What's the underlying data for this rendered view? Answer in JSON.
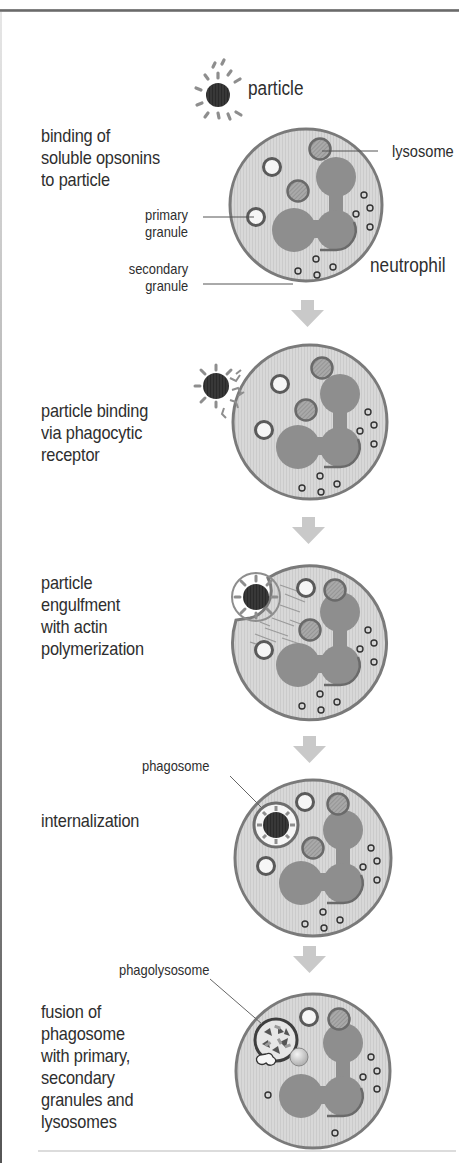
{
  "figure": {
    "colors": {
      "cytoplasm": "#d6d6d6",
      "cell_border": "#7a7a7a",
      "nucleus": "#8c8c8c",
      "nucleus_edge": "#6e6e6e",
      "lysosome": "#a8a8a8",
      "particle": "#333333",
      "opsonin": "#9a9a9a",
      "arrow": "#c9c9c9",
      "text": "#2e2e2e"
    }
  },
  "labels": {
    "particle": "particle",
    "lysosome": "lysosome",
    "primary_granule": "primary\ngranule",
    "secondary_granule": "secondary\ngranule",
    "neutrophil": "neutrophil",
    "phagosome": "phagosome",
    "phagolysosome": "phagolysosome"
  },
  "steps": [
    {
      "id": 1,
      "label": "binding of\nsoluble opsonins\nto particle"
    },
    {
      "id": 2,
      "label": "particle binding\nvia phagocytic\nreceptor"
    },
    {
      "id": 3,
      "label": "particle\nengulfment\nwith actin\npolymerization"
    },
    {
      "id": 4,
      "label": "internalization"
    },
    {
      "id": 5,
      "label": "fusion of\nphagosome\nwith primary,\nsecondary\ngranules and\nlysosomes"
    }
  ]
}
